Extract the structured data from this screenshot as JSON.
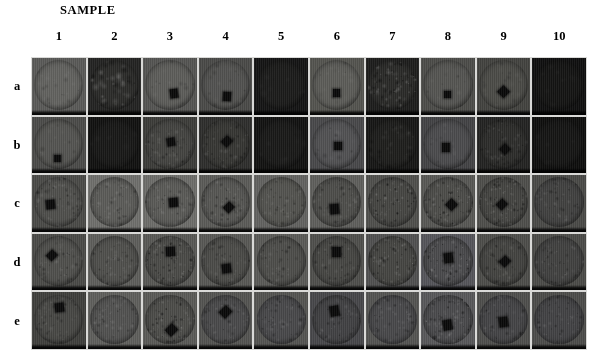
{
  "figure": {
    "title": "SAMPLE",
    "column_headers": [
      "1",
      "2",
      "3",
      "4",
      "5",
      "6",
      "7",
      "8",
      "9",
      "10"
    ],
    "row_labels": [
      "a",
      "b",
      "c",
      "d",
      "e"
    ],
    "grid_size": {
      "rows": 5,
      "columns": 10
    },
    "background_color": "#ffffff",
    "text_color": "#000000",
    "cell_border_color": "#d9d9d7"
  },
  "cells": [
    [
      {
        "id": "a1",
        "brightness": "#5a5a58",
        "specimen": "#62625f",
        "texture": "smooth",
        "inclusion": null,
        "marks": "two small dark spots lower right"
      },
      {
        "id": "a2",
        "brightness": "#232322",
        "specimen": "#2b2b29",
        "texture": "mottled-bright-center",
        "inclusion": null,
        "marks": "irregular bright cluster center"
      },
      {
        "id": "a3",
        "brightness": "#555553",
        "specimen": "#5d5d5a",
        "texture": "smooth",
        "inclusion": {
          "shape": "square",
          "cx": 58,
          "cy": 62,
          "size": 15,
          "rotate": -8
        }
      },
      {
        "id": "a4",
        "brightness": "#4a4a48",
        "specimen": "#525250",
        "texture": "smooth",
        "inclusion": {
          "shape": "square",
          "cx": 52,
          "cy": 68,
          "size": 15,
          "rotate": 4
        }
      },
      {
        "id": "a5",
        "brightness": "#141414",
        "specimen": "#1b1b1a",
        "texture": "dark-uniform",
        "inclusion": null
      },
      {
        "id": "a6",
        "brightness": "#54544f",
        "specimen": "#5c5c58",
        "texture": "smooth",
        "inclusion": {
          "shape": "square",
          "cx": 50,
          "cy": 62,
          "size": 13,
          "rotate": 0
        }
      },
      {
        "id": "a7",
        "brightness": "#1d1d1c",
        "specimen": "#2a2a28",
        "texture": "heavy-mottle",
        "inclusion": null,
        "marks": "bright granular network"
      },
      {
        "id": "a8",
        "brightness": "#4c4c49",
        "specimen": "#555552",
        "texture": "smooth",
        "inclusion": {
          "shape": "square",
          "cx": 50,
          "cy": 64,
          "size": 13,
          "rotate": 0
        }
      },
      {
        "id": "a9",
        "brightness": "#43433f",
        "specimen": "#4b4b47",
        "texture": "smooth",
        "inclusion": {
          "shape": "diamond",
          "cx": 50,
          "cy": 60,
          "size": 16,
          "rotate": 45
        }
      },
      {
        "id": "a10",
        "brightness": "#0f0f0f",
        "specimen": "#141413",
        "texture": "dark-uniform",
        "inclusion": null
      }
    ],
    [
      {
        "id": "b1",
        "brightness": "#4b4b49",
        "specimen": "#545451",
        "texture": "smooth",
        "inclusion": {
          "shape": "square",
          "cx": 48,
          "cy": 74,
          "size": 13,
          "rotate": 0
        }
      },
      {
        "id": "b2",
        "brightness": "#111110",
        "specimen": "#181817",
        "texture": "dark-uniform",
        "inclusion": null
      },
      {
        "id": "b3",
        "brightness": "#3c3c39",
        "specimen": "#444441",
        "texture": "granular",
        "inclusion": {
          "shape": "square",
          "cx": 52,
          "cy": 44,
          "size": 14,
          "rotate": -10
        }
      },
      {
        "id": "b4",
        "brightness": "#2e2e2c",
        "specimen": "#363633",
        "texture": "granular",
        "inclusion": {
          "shape": "diamond",
          "cx": 52,
          "cy": 44,
          "size": 15,
          "rotate": 45
        }
      },
      {
        "id": "b5",
        "brightness": "#121211",
        "specimen": "#191918",
        "texture": "dark-uniform",
        "inclusion": null
      },
      {
        "id": "b6",
        "brightness": "#48484a",
        "specimen": "#515153",
        "texture": "smooth",
        "inclusion": {
          "shape": "square",
          "cx": 52,
          "cy": 52,
          "size": 14,
          "rotate": 0
        }
      },
      {
        "id": "b7",
        "brightness": "#161615",
        "specimen": "#1e1e1c",
        "texture": "dark-mottle",
        "inclusion": null
      },
      {
        "id": "b8",
        "brightness": "#434345",
        "specimen": "#4b4b4d",
        "texture": "smooth",
        "inclusion": {
          "shape": "square",
          "cx": 46,
          "cy": 54,
          "size": 16,
          "rotate": 0
        }
      },
      {
        "id": "b9",
        "brightness": "#232322",
        "specimen": "#2c2c2a",
        "texture": "granular",
        "inclusion": {
          "shape": "diamond",
          "cx": 52,
          "cy": 58,
          "size": 14,
          "rotate": 45
        }
      },
      {
        "id": "b10",
        "brightness": "#0e0e0d",
        "specimen": "#151514",
        "texture": "dark-uniform",
        "inclusion": null
      }
    ],
    [
      {
        "id": "c1",
        "brightness": "#4a4a47",
        "specimen": "#4f4f4c",
        "texture": "granular",
        "inclusion": {
          "shape": "square",
          "cx": 34,
          "cy": 52,
          "size": 16,
          "rotate": -6
        }
      },
      {
        "id": "c2",
        "brightness": "#6f6f6c",
        "specimen": "#5b5b58",
        "texture": "granular-light-bg",
        "inclusion": null
      },
      {
        "id": "c3",
        "brightness": "#6d6d6a",
        "specimen": "#5a5a57",
        "texture": "granular-light-bg",
        "inclusion": {
          "shape": "square",
          "cx": 57,
          "cy": 48,
          "size": 16,
          "rotate": -5
        }
      },
      {
        "id": "c4",
        "brightness": "#5b5b58",
        "specimen": "#565653",
        "texture": "granular",
        "inclusion": {
          "shape": "diamond",
          "cx": 57,
          "cy": 56,
          "size": 15,
          "rotate": 45
        }
      },
      {
        "id": "c5",
        "brightness": "#626260",
        "specimen": "#53534f",
        "texture": "granular-light-bg",
        "inclusion": null
      },
      {
        "id": "c6",
        "brightness": "#5f5f5c",
        "specimen": "#4d4d4a",
        "texture": "granular",
        "inclusion": {
          "shape": "square",
          "cx": 46,
          "cy": 60,
          "size": 17,
          "rotate": -5
        }
      },
      {
        "id": "c7",
        "brightness": "#4f4f4c",
        "specimen": "#454542",
        "texture": "heavy-granular",
        "inclusion": null
      },
      {
        "id": "c8",
        "brightness": "#585855",
        "specimen": "#4c4c49",
        "texture": "heavy-granular",
        "inclusion": {
          "shape": "diamond",
          "cx": 57,
          "cy": 52,
          "size": 16,
          "rotate": 45
        }
      },
      {
        "id": "c9",
        "brightness": "#4e4e4b",
        "specimen": "#444441",
        "texture": "heavy-granular",
        "inclusion": {
          "shape": "diamond",
          "cx": 48,
          "cy": 52,
          "size": 15,
          "rotate": 45
        }
      },
      {
        "id": "c10",
        "brightness": "#4a4a47",
        "specimen": "#414140",
        "texture": "granular",
        "inclusion": null
      }
    ],
    [
      {
        "id": "d1",
        "brightness": "#4a4a47",
        "specimen": "#4f4f4c",
        "texture": "granular",
        "inclusion": {
          "shape": "diamond",
          "cx": 38,
          "cy": 38,
          "size": 15,
          "rotate": 45
        }
      },
      {
        "id": "d2",
        "brightness": "#5e5e5b",
        "specimen": "#4f4f4c",
        "texture": "granular-light-bg",
        "inclusion": null
      },
      {
        "id": "d3",
        "brightness": "#585855",
        "specimen": "#4a4a47",
        "texture": "heavy-granular",
        "inclusion": {
          "shape": "square",
          "cx": 50,
          "cy": 32,
          "size": 16,
          "rotate": -4
        }
      },
      {
        "id": "d4",
        "brightness": "#585855",
        "specimen": "#4b4b48",
        "texture": "granular",
        "inclusion": {
          "shape": "square",
          "cx": 52,
          "cy": 62,
          "size": 16,
          "rotate": -8
        }
      },
      {
        "id": "d5",
        "brightness": "#5a5a57",
        "specimen": "#4d4d4a",
        "texture": "granular",
        "inclusion": null
      },
      {
        "id": "d6",
        "brightness": "#4f4f4c",
        "specimen": "#464643",
        "texture": "granular",
        "inclusion": {
          "shape": "square",
          "cx": 50,
          "cy": 32,
          "size": 17,
          "rotate": 0
        }
      },
      {
        "id": "d7",
        "brightness": "#505050",
        "specimen": "#454542",
        "texture": "heavy-granular",
        "inclusion": null
      },
      {
        "id": "d8",
        "brightness": "#55555a",
        "specimen": "#4a4a4c",
        "texture": "heavy-granular",
        "inclusion": {
          "shape": "square",
          "cx": 52,
          "cy": 42,
          "size": 17,
          "rotate": -8
        }
      },
      {
        "id": "d9",
        "brightness": "#4d4d4a",
        "specimen": "#434340",
        "texture": "granular",
        "inclusion": {
          "shape": "diamond",
          "cx": 52,
          "cy": 48,
          "size": 15,
          "rotate": 45
        }
      },
      {
        "id": "d10",
        "brightness": "#4b4b48",
        "specimen": "#414140",
        "texture": "granular",
        "inclusion": null
      }
    ],
    [
      {
        "id": "e1",
        "brightness": "#3f3f3c",
        "specimen": "#474744",
        "texture": "granular",
        "inclusion": {
          "shape": "square",
          "cx": 50,
          "cy": 26,
          "size": 16,
          "rotate": -8
        }
      },
      {
        "id": "e2",
        "brightness": "#5f5f5c",
        "specimen": "#515150",
        "texture": "granular-light-bg",
        "inclusion": null
      },
      {
        "id": "e3",
        "brightness": "#5a5a57",
        "specimen": "#4c4c49",
        "texture": "heavy-granular",
        "inclusion": {
          "shape": "diamond",
          "cx": 52,
          "cy": 66,
          "size": 17,
          "rotate": 45
        }
      },
      {
        "id": "e4",
        "brightness": "#545451",
        "specimen": "#49494a",
        "texture": "granular",
        "inclusion": {
          "shape": "diamond",
          "cx": 50,
          "cy": 34,
          "size": 17,
          "rotate": 45
        }
      },
      {
        "id": "e5",
        "brightness": "#545451",
        "specimen": "#48484a",
        "texture": "granular",
        "inclusion": null
      },
      {
        "id": "e6",
        "brightness": "#47474a",
        "specimen": "#414143",
        "texture": "granular",
        "inclusion": {
          "shape": "square",
          "cx": 46,
          "cy": 32,
          "size": 17,
          "rotate": -10
        }
      },
      {
        "id": "e7",
        "brightness": "#545452",
        "specimen": "#48484a",
        "texture": "granular",
        "inclusion": null
      },
      {
        "id": "e8",
        "brightness": "#58585a",
        "specimen": "#4a4a4c",
        "texture": "heavy-granular",
        "inclusion": {
          "shape": "square",
          "cx": 50,
          "cy": 58,
          "size": 17,
          "rotate": -10
        }
      },
      {
        "id": "e9",
        "brightness": "#4e4e4c",
        "specimen": "#444446",
        "texture": "granular",
        "inclusion": {
          "shape": "square",
          "cx": 50,
          "cy": 52,
          "size": 17,
          "rotate": -8
        }
      },
      {
        "id": "e10",
        "brightness": "#4c4c4a",
        "specimen": "#424244",
        "texture": "granular",
        "inclusion": null
      }
    ]
  ]
}
